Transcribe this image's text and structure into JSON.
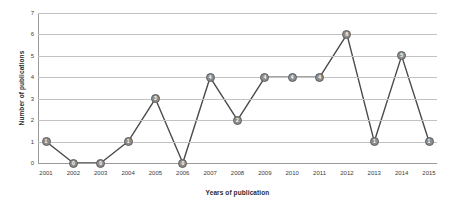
{
  "chart_data": {
    "type": "line",
    "title": "",
    "xlabel": "Years of publication",
    "ylabel": "Number of publications",
    "categories": [
      "2001",
      "2002",
      "2003",
      "2004",
      "2005",
      "2006",
      "2007",
      "2008",
      "2009",
      "2010",
      "2011",
      "2012",
      "2013",
      "2014",
      "2015"
    ],
    "values": [
      1,
      0,
      0,
      1,
      3,
      0,
      4,
      2,
      4,
      4,
      4,
      6,
      1,
      5,
      1
    ],
    "data_labels": [
      "1",
      "0",
      "0",
      "1",
      "3",
      "0",
      "4",
      "2",
      "4",
      "4",
      "4",
      "6",
      "1",
      "5",
      "1"
    ],
    "ylim": [
      0,
      7
    ],
    "y_ticks": [
      "0",
      "1",
      "2",
      "3",
      "4",
      "5",
      "6",
      "7"
    ],
    "grid": true,
    "legend": "none",
    "colors": {
      "line": "#4a4a4a",
      "marker_fill": "#8d8d8d",
      "marker_stroke": "#5e5e5e",
      "gridline": "#c2c2c2",
      "axis": "#9a9a9a",
      "text": "#3b3b3b",
      "background": "#ffffff"
    }
  }
}
